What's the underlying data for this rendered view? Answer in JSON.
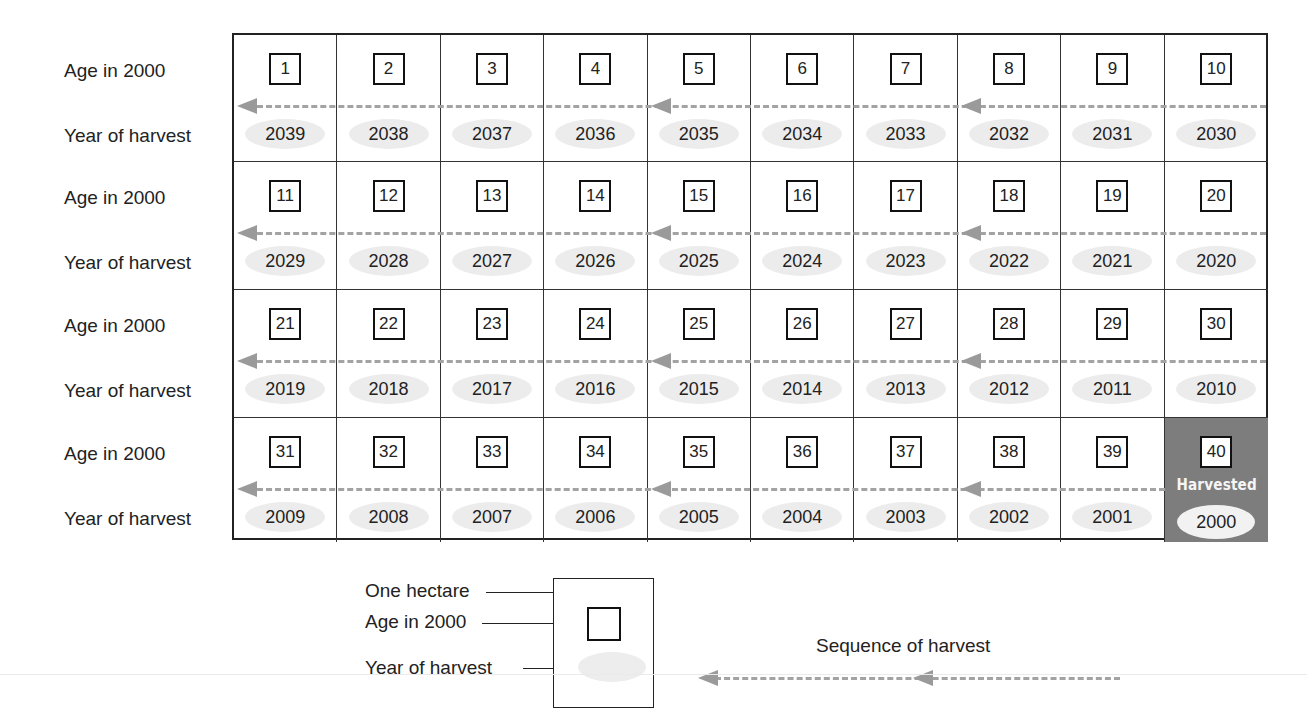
{
  "diagram": {
    "title": "",
    "row_labels": {
      "age": "Age in 2000",
      "year": "Year of harvest"
    },
    "grid": {
      "columns": 10,
      "rows": [
        {
          "ages": [
            "1",
            "2",
            "3",
            "4",
            "5",
            "6",
            "7",
            "8",
            "9",
            "10"
          ],
          "years": [
            "2039",
            "2038",
            "2037",
            "2036",
            "2035",
            "2034",
            "2033",
            "2032",
            "2031",
            "2030"
          ]
        },
        {
          "ages": [
            "11",
            "12",
            "13",
            "14",
            "15",
            "16",
            "17",
            "18",
            "19",
            "20"
          ],
          "years": [
            "2029",
            "2028",
            "2027",
            "2026",
            "2025",
            "2024",
            "2023",
            "2022",
            "2021",
            "2020"
          ]
        },
        {
          "ages": [
            "21",
            "22",
            "23",
            "24",
            "25",
            "26",
            "27",
            "28",
            "29",
            "30"
          ],
          "years": [
            "2019",
            "2018",
            "2017",
            "2016",
            "2015",
            "2014",
            "2013",
            "2012",
            "2011",
            "2010"
          ]
        },
        {
          "ages": [
            "31",
            "32",
            "33",
            "34",
            "35",
            "36",
            "37",
            "38",
            "39",
            "40"
          ],
          "years": [
            "2009",
            "2008",
            "2007",
            "2006",
            "2005",
            "2004",
            "2003",
            "2002",
            "2001",
            "2000"
          ]
        }
      ],
      "harvested_cell": {
        "row": 3,
        "col": 9,
        "label": "Harvested",
        "color": "#7d7d7d"
      },
      "arrowhead_columns": [
        0,
        4,
        7
      ]
    },
    "legend": {
      "one_hectare": "One hectare",
      "age_in_2000": "Age in 2000",
      "year_of_harvest": "Year of harvest",
      "sequence_of_harvest": "Sequence of harvest"
    },
    "colors": {
      "border": "#222222",
      "dash": "#a3a3a3",
      "oval": "#ececec",
      "harvested": "#7d7d7d"
    }
  }
}
